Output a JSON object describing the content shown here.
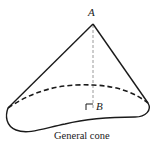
{
  "diagram": {
    "type": "geometric-figure",
    "title": "General cone",
    "points": {
      "apex": {
        "label": "A"
      },
      "foot": {
        "label": "B"
      }
    },
    "caption": "General cone",
    "elements": [
      {
        "kind": "solid-edge",
        "from": "A",
        "to": "left-base-corner"
      },
      {
        "kind": "solid-edge",
        "from": "A",
        "to": "right-base-corner"
      },
      {
        "kind": "dashed-altitude",
        "from": "A",
        "to": "B"
      },
      {
        "kind": "right-angle-marker",
        "at": "B"
      },
      {
        "kind": "dashed-curve",
        "description": "hidden back edge of base"
      },
      {
        "kind": "solid-curve",
        "description": "visible front edge of irregular base"
      }
    ],
    "colors": {
      "stroke": "#1a1a1a",
      "altitude": "#9a9a9a",
      "background": "#ffffff"
    }
  }
}
